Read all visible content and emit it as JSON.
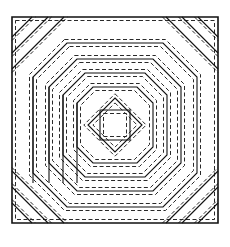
{
  "diagram": {
    "type": "quilt-block",
    "pattern": "pineapple",
    "colors": {
      "line": "#111111",
      "background": "#ffffff"
    },
    "outer_square": {
      "x": 12,
      "y": 17,
      "size": 206
    },
    "center": {
      "x": 115,
      "y": 125
    },
    "center_square_half": 15,
    "rings": [
      {
        "kind": "diamond",
        "half": 27
      },
      {
        "kind": "octagon",
        "half": 38,
        "cut": 16
      },
      {
        "kind": "octagon",
        "half": 52,
        "cut": 22
      },
      {
        "kind": "octagon",
        "half": 66,
        "cut": 28
      },
      {
        "kind": "octagon",
        "half": 82,
        "cut": 34
      }
    ],
    "corner_stripes": [
      20,
      36,
      52
    ],
    "seam_offset": 3.5
  }
}
